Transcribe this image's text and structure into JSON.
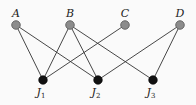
{
  "diagram": {
    "type": "bipartite-graph",
    "top_nodes": [
      {
        "id": "A",
        "label": "A",
        "x": 16,
        "y": 25
      },
      {
        "id": "B",
        "label": "B",
        "x": 70,
        "y": 25
      },
      {
        "id": "C",
        "label": "C",
        "x": 125,
        "y": 25
      },
      {
        "id": "D",
        "label": "D",
        "x": 180,
        "y": 25
      }
    ],
    "bottom_nodes": [
      {
        "id": "J1",
        "label": "J",
        "sub": "1",
        "x": 43,
        "y": 80
      },
      {
        "id": "J2",
        "label": "J",
        "sub": "2",
        "x": 98,
        "y": 80
      },
      {
        "id": "J3",
        "label": "J",
        "sub": "3",
        "x": 153,
        "y": 80
      }
    ],
    "edges": [
      [
        "A",
        "J1"
      ],
      [
        "A",
        "J2"
      ],
      [
        "B",
        "J1"
      ],
      [
        "B",
        "J2"
      ],
      [
        "B",
        "J3"
      ],
      [
        "C",
        "J1"
      ],
      [
        "D",
        "J2"
      ],
      [
        "D",
        "J3"
      ]
    ],
    "colors": {
      "top_node_fill": "#8c8c8c",
      "bottom_node_fill": "#111111",
      "edge": "#333333",
      "background": "#fafafa"
    }
  }
}
